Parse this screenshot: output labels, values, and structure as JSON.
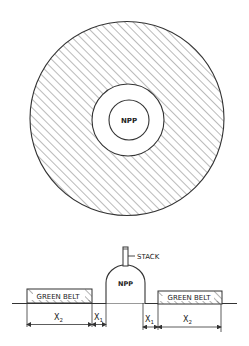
{
  "plan_view": {
    "center_label": "NPP",
    "zones": [
      {
        "name": "npp-site",
        "fill": "none"
      },
      {
        "name": "exclusion-zone",
        "fill": "none"
      },
      {
        "name": "green-belt",
        "fill": "hatched"
      }
    ]
  },
  "section_view": {
    "building_label": "NPP",
    "stack_label": "STACK",
    "left_belt_label": "GREEN BELT",
    "right_belt_label": "GREEN BELT",
    "dimensions": {
      "left_x2": "X",
      "left_x2_sub": "2",
      "left_x1": "X",
      "left_x1_sub": "1",
      "right_x1": "X",
      "right_x1_sub": "1",
      "right_x2": "X",
      "right_x2_sub": "2"
    }
  },
  "colors": {
    "line": "#333333",
    "hatch": "#555555",
    "background": "#ffffff"
  }
}
